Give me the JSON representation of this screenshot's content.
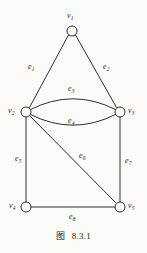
{
  "figure": {
    "caption_label": "图",
    "caption_number": "8.3.1",
    "background_color": "#fbfbfa",
    "ink_color": "#2e2e2e"
  },
  "graph": {
    "vertices": [
      {
        "id": "v1",
        "label": "v",
        "sub": "1",
        "cx": 72,
        "cy": 31,
        "r": 5,
        "label_x": 67,
        "label_y": 12
      },
      {
        "id": "v2",
        "label": "v",
        "sub": "2",
        "cx": 26,
        "cy": 112,
        "r": 5,
        "label_x": 8,
        "label_y": 107
      },
      {
        "id": "v3",
        "label": "v",
        "sub": "3",
        "cx": 120,
        "cy": 112,
        "r": 5,
        "label_x": 128,
        "label_y": 107
      },
      {
        "id": "v4",
        "label": "v",
        "sub": "4",
        "cx": 26,
        "cy": 207,
        "r": 5,
        "label_x": 9,
        "label_y": 202
      },
      {
        "id": "v5",
        "label": "v",
        "sub": "5",
        "cx": 120,
        "cy": 207,
        "r": 5,
        "label_x": 128,
        "label_y": 202
      }
    ],
    "edges": [
      {
        "id": "e1",
        "label": "e",
        "sub": "1",
        "from": "v1",
        "to": "v2",
        "shape": "line",
        "d": "M 68.5 35 L 29.5 107.5",
        "label_x": 28,
        "label_y": 63
      },
      {
        "id": "e2",
        "label": "e",
        "sub": "2",
        "from": "v1",
        "to": "v3",
        "shape": "line",
        "d": "M 75.5 35 L 116.5 107.5",
        "label_x": 103,
        "label_y": 63
      },
      {
        "id": "e3",
        "label": "e",
        "sub": "3",
        "from": "v2",
        "to": "v3",
        "shape": "curve",
        "d": "M 30.5 109.5 Q 73 88 115.5 109.5",
        "label_x": 68,
        "label_y": 85
      },
      {
        "id": "e4",
        "label": "e",
        "sub": "4",
        "from": "v2",
        "to": "v3",
        "shape": "curve",
        "d": "M 30.5 114.5 Q 73 136 115.5 114.5",
        "label_x": 68,
        "label_y": 117
      },
      {
        "id": "e5",
        "label": "e",
        "sub": "5",
        "from": "v2",
        "to": "v4",
        "shape": "line",
        "d": "M 26 117 L 26 202",
        "label_x": 15,
        "label_y": 155
      },
      {
        "id": "e6",
        "label": "e",
        "sub": "6",
        "from": "v2",
        "to": "v5",
        "shape": "line",
        "d": "M 30 116 L 116 203",
        "label_x": 79,
        "label_y": 152
      },
      {
        "id": "e7",
        "label": "e",
        "sub": "7",
        "from": "v3",
        "to": "v5",
        "shape": "line",
        "d": "M 120 117 L 120 202",
        "label_x": 125,
        "label_y": 157
      },
      {
        "id": "e8",
        "label": "e",
        "sub": "8",
        "from": "v4",
        "to": "v5",
        "shape": "line",
        "d": "M 31 207 L 115 207",
        "label_x": 69,
        "label_y": 213
      }
    ]
  }
}
